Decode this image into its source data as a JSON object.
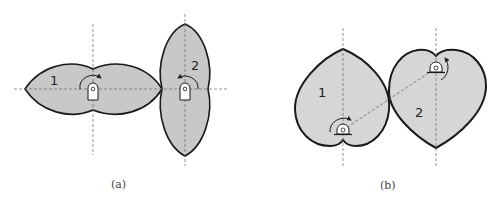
{
  "figure": {
    "panel_a": {
      "caption": "(a)",
      "gear_1_label": "1",
      "gear_2_label": "2",
      "description": "Two elliptical-lobed noncircular gears meshing; gear 1 horizontal, gear 2 vertical"
    },
    "panel_b": {
      "caption": "(b)",
      "gear_1_label": "1",
      "gear_2_label": "2",
      "description": "Two heart-shaped noncircular gears with offset pivots connected by a dashed center line"
    },
    "colors": {
      "fill": "#c8c8c8",
      "fill_b": "#d6d6d6",
      "stroke": "#1a1a1a",
      "axis": "#666666"
    }
  }
}
